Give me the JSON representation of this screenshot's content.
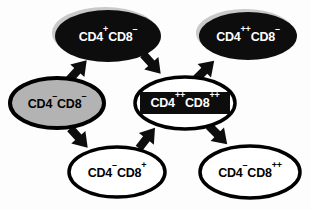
{
  "diagram": {
    "colors": {
      "filled_dark": "#0d0d0d",
      "filled_gray": "#b3b3b3",
      "outline": "#000000",
      "text_light": "#ffffff",
      "text_dark": "#000000",
      "background": "#fdfdfd",
      "shadow": "#c9c9c9"
    },
    "nodes": [
      {
        "id": "cd4p-cd8n",
        "name": "node-cd4-plus-cd8-minus",
        "base1": "CD4",
        "sup1": "+",
        "base2": "CD8",
        "sup2": "–",
        "full_label": "CD4+CD8–",
        "style": "black-filled",
        "fill": "#0d0d0d",
        "text_color": "#ffffff",
        "cx": 108,
        "cy": 36,
        "rx": 53,
        "ry": 26
      },
      {
        "id": "cd4pp-cd8n",
        "name": "node-cd4-plusplus-cd8-minus",
        "base1": "CD4",
        "sup1": "++",
        "base2": "CD8",
        "sup2": "–",
        "full_label": "CD4++CD8–",
        "style": "black-filled",
        "fill": "#0d0d0d",
        "text_color": "#ffffff",
        "cx": 248,
        "cy": 36,
        "rx": 49,
        "ry": 24
      },
      {
        "id": "cd4n-cd8n",
        "name": "node-cd4-minus-cd8-minus",
        "base1": "CD4",
        "sup1": "–",
        "base2": "CD8",
        "sup2": "–",
        "full_label": "CD4–CD8–",
        "style": "gray-filled",
        "fill": "#b3b3b3",
        "text_color": "#000000",
        "cx": 57,
        "cy": 103,
        "rx": 47,
        "ry": 25
      },
      {
        "id": "cd4pp-cd8pp",
        "name": "node-cd4-plusplus-cd8-plusplus",
        "base1": "CD4",
        "sup1": "++",
        "base2": "CD8",
        "sup2": "++",
        "full_label": "CD4++CD8++",
        "style": "outlined-with-black-box",
        "fill": "#ffffff",
        "text_color": "#ffffff",
        "cx": 185,
        "cy": 103,
        "rx": 50,
        "ry": 26
      },
      {
        "id": "cd4n-cd8p",
        "name": "node-cd4-minus-cd8-plus",
        "base1": "CD4",
        "sup1": "–",
        "base2": "CD8",
        "sup2": "+",
        "full_label": "CD4–CD8+",
        "style": "outlined",
        "fill": "#ffffff",
        "text_color": "#000000",
        "cx": 117,
        "cy": 172,
        "rx": 48,
        "ry": 25
      },
      {
        "id": "cd4n-cd8pp",
        "name": "node-cd4-minus-cd8-plusplus",
        "base1": "CD4",
        "sup1": "–",
        "base2": "CD8",
        "sup2": "++",
        "full_label": "CD4–CD8++",
        "style": "outlined",
        "fill": "#ffffff",
        "text_color": "#000000",
        "cx": 250,
        "cy": 172,
        "rx": 50,
        "ry": 26
      }
    ],
    "arrows": [
      {
        "name": "arrow-dn-to-cd4p",
        "from": "cd4n-cd8n",
        "to": "cd4p-cd8n",
        "direction": "up-right",
        "x": 78,
        "y": 70,
        "angle": -48
      },
      {
        "name": "arrow-cd4p-to-dp",
        "from": "cd4p-cd8n",
        "to": "cd4pp-cd8pp",
        "direction": "down-right",
        "x": 152,
        "y": 64,
        "angle": 48
      },
      {
        "name": "arrow-dp-to-cd4pp",
        "from": "cd4pp-cd8pp",
        "to": "cd4pp-cd8n",
        "direction": "up-right",
        "x": 205,
        "y": 70,
        "angle": -45
      },
      {
        "name": "arrow-dn-to-cd8p",
        "from": "cd4n-cd8n",
        "to": "cd4n-cd8p",
        "direction": "down-right",
        "x": 79,
        "y": 138,
        "angle": 48
      },
      {
        "name": "arrow-cd8p-to-dp",
        "from": "cd4n-cd8p",
        "to": "cd4pp-cd8pp",
        "direction": "up-right",
        "x": 147,
        "y": 138,
        "angle": -52
      },
      {
        "name": "arrow-dp-to-cd8pp",
        "from": "cd4pp-cd8pp",
        "to": "cd4n-cd8pp",
        "direction": "down-right",
        "x": 218,
        "y": 135,
        "angle": 45
      }
    ]
  }
}
